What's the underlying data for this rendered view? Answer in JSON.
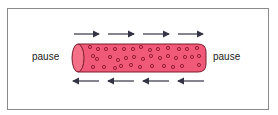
{
  "diagram": {
    "left_label": "pause",
    "right_label": "pause",
    "top_arrows": {
      "direction": "right",
      "count": 4
    },
    "bottom_arrows": {
      "direction": "left",
      "count": 4
    },
    "cylinder": {
      "fill": "#f05a78",
      "stroke": "#7a1a2c",
      "particle_color": "#8a1830"
    },
    "arrow_color": "#333344"
  }
}
